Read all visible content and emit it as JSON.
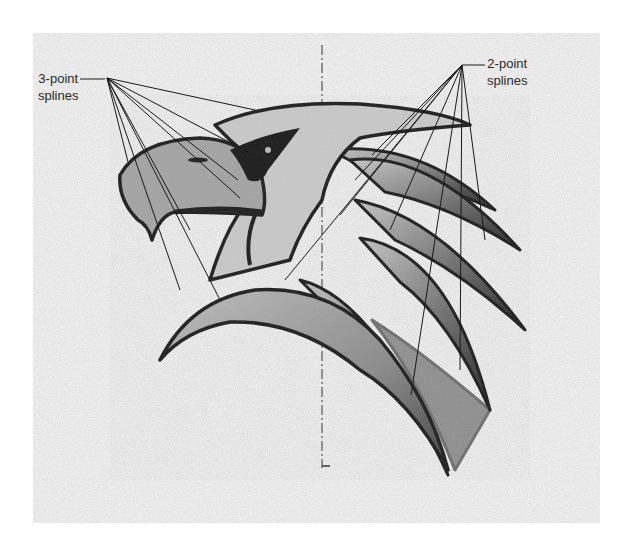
{
  "figure": {
    "background_color": "#e6e6e6",
    "outline_color": "#1e1e1e",
    "fill_light": "#b5b5b5",
    "fill_mid": "#8f8f8f",
    "fill_dark": "#555555",
    "centerline": "vertical dash-dot construction line"
  },
  "labels": {
    "three_point": {
      "line1": "3-point",
      "line2": "splines",
      "leader_count": 8
    },
    "two_point": {
      "line1": "2-point",
      "line2": "splines",
      "leader_count": 8
    }
  }
}
